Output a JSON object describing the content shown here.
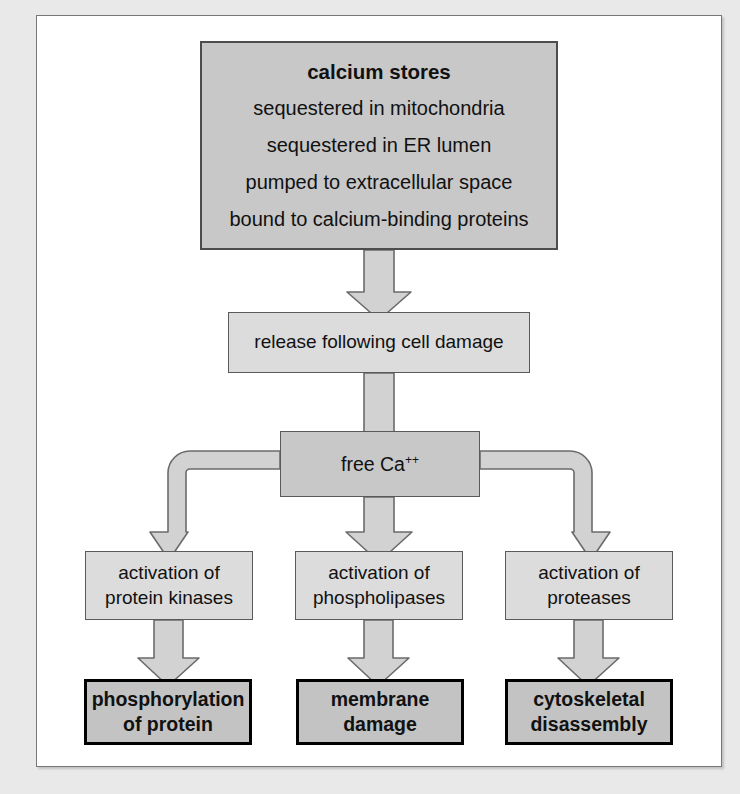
{
  "diagram": {
    "colors": {
      "dark_fill": "#c8c8c8",
      "light_fill": "#dcdcdc",
      "outcome_fill": "#c3c3c3",
      "arrow_fill": "#d2d2d2",
      "arrow_stroke": "#6b6b6b",
      "outcome_border": "#000000",
      "page_bg": "#e9e9e9",
      "frame_bg": "#ffffff"
    },
    "nodes": {
      "store": {
        "title": "calcium stores",
        "lines": [
          "sequestered in mitochondria",
          "sequestered in ER lumen",
          "pumped to extracellular space",
          "bound to calcium-binding proteins"
        ]
      },
      "release": {
        "label": "release following cell damage"
      },
      "free_calcium": {
        "label_prefix": "free Ca",
        "label_sup": "++"
      },
      "activation": [
        {
          "line1": "activation of",
          "line2": "protein kinases"
        },
        {
          "line1": "activation of",
          "line2": "phospholipases"
        },
        {
          "line1": "activation of",
          "line2": "proteases"
        }
      ],
      "outcomes": [
        {
          "line1": "phosphorylation",
          "line2": "of protein"
        },
        {
          "line1": "membrane",
          "line2": "damage"
        },
        {
          "line1": "cytoskeletal",
          "line2": "disassembly"
        }
      ]
    },
    "edges": [
      {
        "from": "store",
        "to": "release",
        "style": "block-arrow-down"
      },
      {
        "from": "release",
        "to": "free_calcium",
        "style": "block-arrow-down"
      },
      {
        "from": "free_calcium",
        "to": "activation-0",
        "style": "block-arrow-elbow-left"
      },
      {
        "from": "free_calcium",
        "to": "activation-1",
        "style": "block-arrow-down"
      },
      {
        "from": "free_calcium",
        "to": "activation-2",
        "style": "block-arrow-elbow-right"
      },
      {
        "from": "activation-0",
        "to": "outcome-0",
        "style": "block-arrow-down"
      },
      {
        "from": "activation-1",
        "to": "outcome-1",
        "style": "block-arrow-down"
      },
      {
        "from": "activation-2",
        "to": "outcome-2",
        "style": "block-arrow-down"
      }
    ]
  }
}
